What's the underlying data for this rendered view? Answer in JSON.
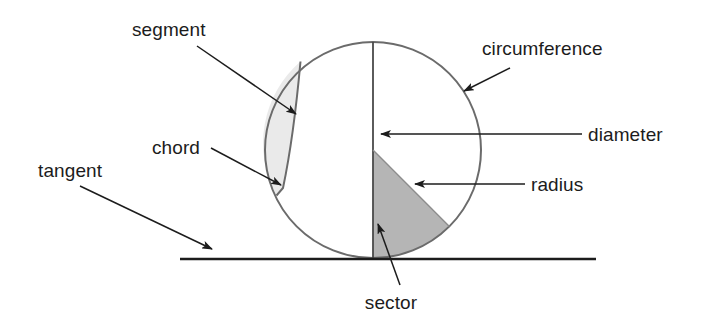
{
  "figure": {
    "background_color": "#ffffff",
    "stroke_color": "#6b6b6b",
    "line_color": "#1c1c1c",
    "segment_fill": "#eaeaea",
    "sector_fill": "#b5b5b5",
    "circle": {
      "center_x": 373,
      "center_y": 150,
      "radius": 108
    }
  },
  "labels": {
    "segment": {
      "text": "segment",
      "x": 132,
      "y": 36,
      "anchor": "start"
    },
    "chord": {
      "text": "chord",
      "x": 152,
      "y": 154,
      "anchor": "start"
    },
    "tangent": {
      "text": "tangent",
      "x": 38,
      "y": 177,
      "anchor": "start"
    },
    "circumference": {
      "text": "circumference",
      "x": 482,
      "y": 55,
      "anchor": "start"
    },
    "diameter": {
      "text": "diameter",
      "x": 588,
      "y": 141,
      "anchor": "start"
    },
    "radius": {
      "text": "radius",
      "x": 531,
      "y": 191,
      "anchor": "start"
    },
    "sector": {
      "text": "sector",
      "x": 391,
      "y": 309,
      "anchor": "middle"
    }
  },
  "leaders": {
    "segment": {
      "x1": 197,
      "y1": 46,
      "x2": 296,
      "y2": 114
    },
    "chord": {
      "x1": 211,
      "y1": 148,
      "x2": 281,
      "y2": 185
    },
    "tangent": {
      "x1": 80,
      "y1": 186,
      "x2": 212,
      "y2": 249
    },
    "circumference": {
      "x1": 510,
      "y1": 68,
      "x2": 464,
      "y2": 91
    },
    "diameter": {
      "x1": 582,
      "y1": 134,
      "x2": 381,
      "y2": 134
    },
    "radius": {
      "x1": 525,
      "y1": 184,
      "x2": 415,
      "y2": 184
    },
    "sector": {
      "x1": 400,
      "y1": 285,
      "x2": 378,
      "y2": 224
    }
  },
  "elements": {
    "circle_outline": "circle-outline",
    "diameter_line": "vertical-diameter-line",
    "chord_line": "chord-line",
    "segment_region": "shaded-segment-region",
    "sector_region": "shaded-sector-region",
    "sector_radius_line": "sector-radius-line",
    "tangent_line": "tangent-line"
  },
  "tangent_line_geometry": {
    "x1": 180,
    "y1": 259,
    "x2": 596,
    "y2": 259
  }
}
